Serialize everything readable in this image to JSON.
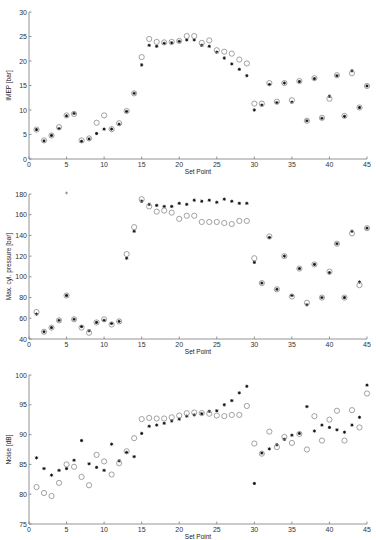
{
  "chart_data": [
    {
      "type": "scatter",
      "title": "",
      "xlabel": "Set Point",
      "ylabel": "IMEP [bar]",
      "xlim": [
        0,
        45
      ],
      "ylim": [
        0,
        30
      ],
      "xticks": [
        0,
        5,
        10,
        15,
        20,
        25,
        30,
        35,
        40,
        45
      ],
      "yticks": [
        0,
        5,
        10,
        15,
        20,
        25,
        30
      ],
      "grid": false,
      "legend": null,
      "x": [
        1,
        2,
        3,
        4,
        5,
        6,
        7,
        8,
        9,
        10,
        11,
        12,
        13,
        14,
        15,
        16,
        17,
        18,
        19,
        20,
        21,
        22,
        23,
        24,
        25,
        26,
        27,
        28,
        29,
        30,
        31,
        32,
        33,
        34,
        35,
        36,
        37,
        38,
        39,
        40,
        41,
        42,
        43,
        44,
        45
      ],
      "series": [
        {
          "name": "star",
          "marker": "*",
          "color": "#111111",
          "values": [
            6.0,
            3.7,
            4.8,
            6.2,
            8.8,
            9.3,
            3.6,
            4.1,
            5.2,
            6.1,
            6.1,
            7.1,
            9.7,
            13.4,
            19.2,
            23.2,
            23.0,
            23.6,
            23.7,
            24.0,
            24.3,
            24.3,
            23.2,
            23.0,
            21.8,
            20.6,
            19.4,
            18.3,
            17.0,
            10.0,
            11.0,
            15.2,
            11.5,
            15.5,
            11.6,
            15.8,
            7.8,
            16.4,
            8.3,
            12.8,
            17.0,
            8.7,
            18.0,
            10.5,
            14.9
          ]
        },
        {
          "name": "circle",
          "marker": "o",
          "color": "#8a8a8a",
          "values": [
            6.0,
            3.8,
            4.8,
            6.5,
            8.9,
            9.2,
            3.8,
            4.2,
            7.4,
            8.9,
            6.1,
            7.3,
            9.8,
            13.4,
            20.8,
            24.5,
            23.9,
            23.8,
            23.9,
            24.1,
            25.1,
            25.1,
            23.7,
            24.2,
            22.2,
            21.9,
            21.5,
            20.3,
            19.5,
            11.3,
            11.3,
            15.5,
            11.7,
            15.5,
            12.0,
            15.9,
            7.8,
            16.5,
            8.4,
            12.3,
            17.1,
            8.8,
            17.5,
            10.5,
            14.9
          ]
        }
      ]
    },
    {
      "type": "scatter",
      "title": "",
      "xlabel": "Set Point",
      "ylabel": "Max. cyl. pressure [bar]",
      "xlim": [
        0,
        45
      ],
      "ylim": [
        40,
        180
      ],
      "xticks": [
        0,
        5,
        10,
        15,
        20,
        25,
        30,
        35,
        40,
        45
      ],
      "yticks": [
        40,
        60,
        80,
        100,
        120,
        140,
        160,
        180
      ],
      "grid": false,
      "legend": null,
      "x": [
        1,
        2,
        3,
        4,
        5,
        6,
        7,
        8,
        9,
        10,
        11,
        12,
        13,
        14,
        15,
        16,
        17,
        18,
        19,
        20,
        21,
        22,
        23,
        24,
        25,
        26,
        27,
        28,
        29,
        30,
        31,
        32,
        33,
        34,
        35,
        36,
        37,
        38,
        39,
        40,
        41,
        42,
        43,
        44,
        45
      ],
      "series": [
        {
          "name": "star",
          "marker": "*",
          "color": "#111111",
          "values": [
            64,
            47,
            51,
            58,
            82,
            59,
            52,
            48,
            56,
            58,
            55,
            57,
            118,
            144,
            173,
            170,
            169,
            168,
            168,
            171,
            170,
            174,
            173,
            174,
            172,
            175,
            173,
            171,
            171,
            114,
            94,
            138,
            88,
            120,
            82,
            108,
            73,
            112,
            80,
            104,
            132,
            80,
            144,
            95,
            147
          ]
        },
        {
          "name": "circle",
          "marker": "o",
          "color": "#8a8a8a",
          "values": [
            66,
            47,
            51,
            58,
            82,
            59,
            51,
            46,
            56,
            59,
            54,
            57,
            122,
            148,
            175,
            168,
            163,
            164,
            162,
            156,
            159,
            159,
            153,
            153,
            153,
            152,
            151,
            154,
            154,
            118,
            94,
            139,
            88,
            120,
            81,
            108,
            75,
            112,
            80,
            105,
            132,
            80,
            142,
            92,
            147
          ]
        }
      ],
      "annotations": [
        {
          "x": 5,
          "y": 181,
          "note": "outlier marker at top of axis"
        }
      ]
    },
    {
      "type": "scatter",
      "title": "",
      "xlabel": "Set Point",
      "ylabel": "Noise [dB]",
      "xlim": [
        0,
        45
      ],
      "ylim": [
        75,
        100
      ],
      "xticks": [
        0,
        5,
        10,
        15,
        20,
        25,
        30,
        35,
        40,
        45
      ],
      "yticks": [
        75,
        80,
        85,
        90,
        95,
        100
      ],
      "grid": false,
      "legend": null,
      "x": [
        1,
        2,
        3,
        4,
        5,
        6,
        7,
        8,
        9,
        10,
        11,
        12,
        13,
        14,
        15,
        16,
        17,
        18,
        19,
        20,
        21,
        22,
        23,
        24,
        25,
        26,
        27,
        28,
        29,
        30,
        31,
        32,
        33,
        34,
        35,
        36,
        37,
        38,
        39,
        40,
        41,
        42,
        43,
        44,
        45
      ],
      "series": [
        {
          "name": "star",
          "marker": "*",
          "color": "#111111",
          "values": [
            86.1,
            84.3,
            83.2,
            84.0,
            84.3,
            85.7,
            89.0,
            85.1,
            84.5,
            84.0,
            88.4,
            85.6,
            87.0,
            86.3,
            90.2,
            91.4,
            91.6,
            91.9,
            92.3,
            92.6,
            93.1,
            93.3,
            93.5,
            93.9,
            94.0,
            95.0,
            95.7,
            97.0,
            98.1,
            81.8,
            86.9,
            87.6,
            88.3,
            89.2,
            89.9,
            90.2,
            94.7,
            90.6,
            91.6,
            91.2,
            90.8,
            90.4,
            91.6,
            92.9,
            98.3
          ]
        },
        {
          "name": "circle",
          "marker": "o",
          "color": "#8a8a8a",
          "values": [
            81.2,
            80.2,
            79.7,
            81.9,
            85.0,
            84.6,
            82.9,
            81.5,
            86.6,
            85.5,
            83.3,
            85.2,
            87.2,
            89.4,
            92.6,
            92.8,
            92.7,
            92.7,
            92.9,
            93.2,
            93.6,
            93.7,
            93.6,
            93.5,
            93.2,
            93.1,
            93.3,
            93.3,
            94.8,
            88.5,
            86.8,
            90.5,
            87.9,
            89.6,
            88.6,
            90.1,
            87.5,
            93.1,
            89.0,
            92.5,
            94.0,
            89.0,
            94.1,
            91.2,
            96.9
          ]
        }
      ]
    }
  ],
  "layout": {
    "panels": [
      {
        "x0": 29,
        "x1": 367,
        "yTop": 12,
        "yBottom": 159
      },
      {
        "x0": 29,
        "x1": 367,
        "yTop": 194,
        "yBottom": 339
      },
      {
        "x0": 29,
        "x1": 367,
        "yTop": 375,
        "yBottom": 524
      }
    ]
  }
}
